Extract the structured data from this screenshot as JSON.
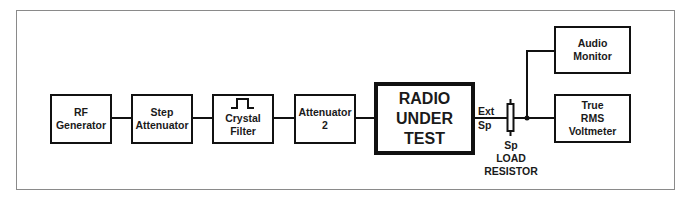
{
  "diagram": {
    "blocks": [
      {
        "id": "rf-generator",
        "lines": [
          "RF",
          "Generator"
        ]
      },
      {
        "id": "step-attenuator",
        "lines": [
          "Step",
          "Attenuator"
        ]
      },
      {
        "id": "crystal-filter",
        "lines": [
          "Crystal",
          "Filter"
        ],
        "icon": "bandpass-pulse-icon"
      },
      {
        "id": "attenuator-2",
        "lines": [
          "Attenuator",
          "2"
        ]
      },
      {
        "id": "radio-under-test",
        "lines": [
          "RADIO",
          "UNDER",
          "TEST"
        ]
      },
      {
        "id": "audio-monitor",
        "lines": [
          "Audio",
          "Monitor"
        ]
      },
      {
        "id": "true-rms-voltmeter",
        "lines": [
          "True",
          "RMS",
          "Voltmeter"
        ]
      }
    ],
    "labels": {
      "ext": "Ext",
      "sp": "Sp",
      "resistor_lines": [
        "Sp",
        "LOAD",
        "RESISTOR"
      ]
    },
    "connections": [
      [
        "rf-generator",
        "step-attenuator"
      ],
      [
        "step-attenuator",
        "crystal-filter"
      ],
      [
        "crystal-filter",
        "attenuator-2"
      ],
      [
        "attenuator-2",
        "radio-under-test"
      ],
      [
        "radio-under-test",
        "load-resistor"
      ],
      [
        "load-resistor",
        "junction"
      ],
      [
        "junction",
        "audio-monitor"
      ],
      [
        "junction",
        "true-rms-voltmeter"
      ]
    ],
    "colors": {
      "line": "#111111",
      "frame": "#8a8a8a",
      "background": "#ffffff"
    }
  }
}
